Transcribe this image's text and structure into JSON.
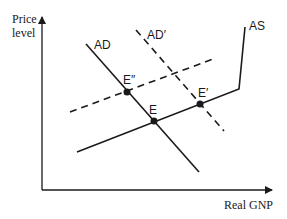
{
  "diagram": {
    "y_axis_label_line1": "Price",
    "y_axis_label_line2": "level",
    "x_axis_label": "Real GNP",
    "curves": [
      {
        "id": "AD",
        "label": "AD",
        "style": "solid"
      },
      {
        "id": "AD_prime",
        "label": "AD′",
        "style": "dashed"
      },
      {
        "id": "AS",
        "label": "AS",
        "style": "solid"
      },
      {
        "id": "AS_shifted",
        "label": "",
        "style": "dashed"
      }
    ],
    "points": [
      {
        "id": "E",
        "label": "E"
      },
      {
        "id": "E_prime",
        "label": "E′"
      },
      {
        "id": "E_double_prime",
        "label": "E″"
      }
    ],
    "colors": {
      "line": "#1a1a1a",
      "background": "#ffffff"
    }
  }
}
